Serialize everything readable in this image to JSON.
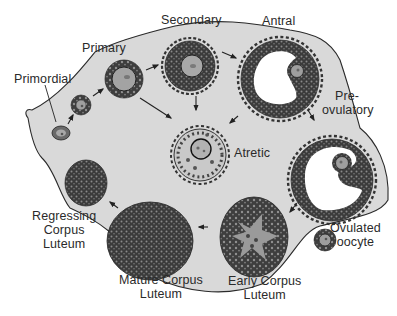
{
  "diagram": {
    "colors": {
      "ovary_fill": "#d9d9d9",
      "outline": "#222222",
      "granulosa_dark": "#3a3a3a",
      "antrum": "#ffffff",
      "oocyte": "#9a9a9a"
    },
    "stages": [
      {
        "id": "primordial",
        "label": "Primordial"
      },
      {
        "id": "primary",
        "label": "Primary"
      },
      {
        "id": "secondary",
        "label": "Secondary"
      },
      {
        "id": "antral",
        "label": "Antral"
      },
      {
        "id": "preovulatory",
        "label_line1": "Pre-",
        "label_line2": "ovulatory"
      },
      {
        "id": "atretic",
        "label": "Atretic"
      },
      {
        "id": "ovulated_oocyte",
        "label_line1": "Ovulated",
        "label_line2": "oocyte"
      },
      {
        "id": "early_corpus_luteum",
        "label_line1": "Early Corpus",
        "label_line2": "Luteum"
      },
      {
        "id": "mature_corpus_luteum",
        "label_line1": "Mature Corpus",
        "label_line2": "Luteum"
      },
      {
        "id": "regressing_corpus_luteum",
        "label_line1": "Regressing",
        "label_line2": "Corpus",
        "label_line3": "Luteum"
      }
    ],
    "arrows": [
      {
        "from": "primordial",
        "to": "primary-small"
      },
      {
        "from": "primary-small",
        "to": "primary"
      },
      {
        "from": "primary",
        "to": "secondary"
      },
      {
        "from": "primary",
        "to": "atretic"
      },
      {
        "from": "secondary",
        "to": "antral"
      },
      {
        "from": "secondary",
        "to": "atretic"
      },
      {
        "from": "antral",
        "to": "atretic"
      },
      {
        "from": "antral",
        "to": "preovulatory"
      },
      {
        "from": "preovulatory",
        "to": "early_corpus_luteum"
      },
      {
        "from": "early_corpus_luteum",
        "to": "mature_corpus_luteum"
      },
      {
        "from": "mature_corpus_luteum",
        "to": "regressing_corpus_luteum"
      }
    ]
  }
}
